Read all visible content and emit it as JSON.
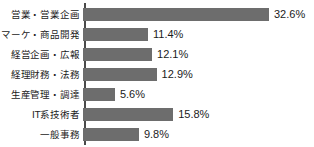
{
  "chart_data": {
    "type": "bar",
    "orientation": "horizontal",
    "title": "",
    "subtitle": "",
    "xlabel": "",
    "ylabel": "",
    "xlim": [
      0,
      32.6
    ],
    "grid": false,
    "legend": false,
    "value_suffix": "%",
    "bar_color": "#6d6d6d",
    "axis_color": "#4a4a4a",
    "text_color": "#1b1b1b",
    "background_color": "#ffffff",
    "categories": [
      "営業・営業企画",
      "マーケ・商品開発",
      "経営企画・広報",
      "経理財務・法務",
      "生産管理・調達",
      "IT系技術者",
      "一般事務"
    ],
    "values": [
      32.6,
      11.4,
      12.1,
      12.9,
      5.6,
      15.8,
      9.8
    ],
    "value_labels": [
      "32.6%",
      "11.4%",
      "12.1%",
      "12.9%",
      "5.6%",
      "15.8%",
      "9.8%"
    ],
    "bars": [
      {
        "category": "営業・営業企画",
        "value": 32.6,
        "label": "32.6%"
      },
      {
        "category": "マーケ・商品開発",
        "value": 11.4,
        "label": "11.4%"
      },
      {
        "category": "経営企画・広報",
        "value": 12.1,
        "label": "12.1%"
      },
      {
        "category": "経理財務・法務",
        "value": 12.9,
        "label": "12.9%"
      },
      {
        "category": "生産管理・調達",
        "value": 5.6,
        "label": "5.6%"
      },
      {
        "category": "IT系技術者",
        "value": 15.8,
        "label": "15.8%"
      },
      {
        "category": "一般事務",
        "value": 9.8,
        "label": "9.8%"
      }
    ]
  }
}
